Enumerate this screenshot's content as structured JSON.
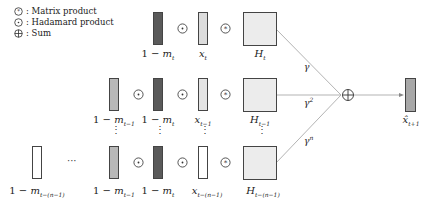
{
  "legend": {
    "items": [
      {
        "symbol": "matrix-product",
        "label": "Matrix product"
      },
      {
        "symbol": "hadamard-product",
        "label": "Hadamard product"
      },
      {
        "symbol": "sum",
        "label": "Sum"
      }
    ],
    "separator": ":"
  },
  "rows": {
    "top": {
      "mask_label": "1 − m",
      "mask_sub": "t",
      "x_label": "x",
      "x_sub": "t",
      "h_label": "H",
      "h_sub": "t",
      "weight": "γ",
      "weight_sup": ""
    },
    "middle": {
      "prev_mask_label": "1 − m",
      "prev_mask_sub": "t−1",
      "mask_label": "1 − m",
      "mask_sub": "t",
      "x_label": "x",
      "x_sub": "t−1",
      "h_label": "H",
      "h_sub": "t−1",
      "weight": "γ",
      "weight_sup": "2"
    },
    "bottom": {
      "first_mask_label": "1 − m",
      "first_mask_sub": "t−(n−1)",
      "ellipsis": "···",
      "prev_mask_label": "1 − m",
      "prev_mask_sub": "t−1",
      "mask_label": "1 − m",
      "mask_sub": "t",
      "x_label": "x",
      "x_sub": "t−(n−1)",
      "h_label": "H",
      "h_sub": "t−(n−1)",
      "weight": "γ",
      "weight_sup": "n"
    }
  },
  "output": {
    "label": "x̂",
    "sub": "t+1"
  },
  "vertical_dots": "⋮"
}
